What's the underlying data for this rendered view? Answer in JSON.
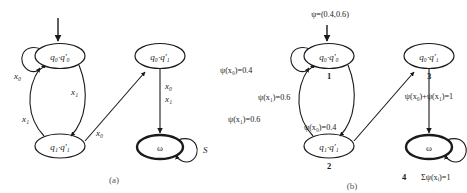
{
  "figure": {
    "background": "#ffffff",
    "stroke": "#1a1a1a",
    "width": 467,
    "height": 193
  },
  "panels": [
    {
      "id": "panel-a",
      "caption": "(a)",
      "header": "",
      "nodes": [
        {
          "id": "a-q0q0",
          "label": "q₀·q′₀",
          "accepting": false,
          "number": ""
        },
        {
          "id": "a-q1q1",
          "label": "q₁·q′₁",
          "accepting": false,
          "number": ""
        },
        {
          "id": "a-q0q1",
          "label": "q₀·q′₁",
          "accepting": false,
          "number": ""
        },
        {
          "id": "a-omega",
          "label": "ω",
          "accepting": true,
          "number": ""
        }
      ],
      "edges": [
        {
          "from": "a-q0q0",
          "to": "a-q0q0",
          "label": "x₀",
          "kind": "self-loop"
        },
        {
          "from": "a-q0q0",
          "to": "a-q1q1",
          "label": "x₁",
          "kind": "curve-down"
        },
        {
          "from": "a-q1q1",
          "to": "a-q0q0",
          "label": "x₁",
          "kind": "curve-up"
        },
        {
          "from": "a-q1q1",
          "to": "a-q0q1",
          "label": "x₀",
          "kind": "diagonal"
        },
        {
          "from": "a-q0q1",
          "to": "a-omega",
          "label": "x₀",
          "kind": "vertical"
        },
        {
          "from": "a-q0q1",
          "to": "a-omega",
          "label": "x₁",
          "kind": "vertical-second"
        },
        {
          "from": "a-omega",
          "to": "a-omega",
          "label": "S",
          "kind": "self-loop-right"
        }
      ]
    },
    {
      "id": "panel-b",
      "caption": "(b)",
      "header": "ψ=(0.4,0.6)",
      "nodes": [
        {
          "id": "b-q0q0",
          "label": "q₀·q′₀",
          "accepting": false,
          "number": "1"
        },
        {
          "id": "b-q1q1",
          "label": "q₁·q′₁",
          "accepting": false,
          "number": "2"
        },
        {
          "id": "b-q0q1",
          "label": "q₀·q′₁",
          "accepting": false,
          "number": "3"
        },
        {
          "id": "b-omega",
          "label": "ω",
          "accepting": true,
          "number": "4"
        }
      ],
      "edges": [
        {
          "from": "b-q0q0",
          "to": "b-q0q0",
          "label": "ψ(x₀)=0.4",
          "kind": "self-loop"
        },
        {
          "from": "b-q0q0",
          "to": "b-q1q1",
          "label": "ψ(x₁)=0.6",
          "kind": "curve-down"
        },
        {
          "from": "b-q1q1",
          "to": "b-q0q0",
          "label": "ψ(x₁)=0.6",
          "kind": "curve-up"
        },
        {
          "from": "b-q1q1",
          "to": "b-q0q1",
          "label": "ψ(x₀)=0.4",
          "kind": "diagonal"
        },
        {
          "from": "b-q0q1",
          "to": "b-omega",
          "label": "ψ(x₀)+ψ(x₁)=1",
          "kind": "vertical"
        },
        {
          "from": "b-omega",
          "to": "b-omega",
          "label": "Σψ(xᵢ)=1",
          "kind": "self-loop-right"
        }
      ]
    }
  ]
}
